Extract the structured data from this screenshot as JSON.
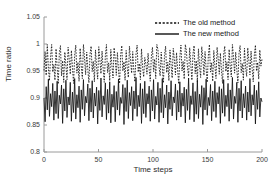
{
  "chart_data": {
    "type": "line",
    "title": "",
    "xlabel": "Time steps",
    "ylabel": "Time ratio",
    "xlim": [
      0,
      200
    ],
    "ylim": [
      0.8,
      1.05
    ],
    "xticks": [
      0,
      50,
      100,
      150,
      200
    ],
    "xtick_labels": [
      "0",
      "50",
      "100",
      "150",
      "200"
    ],
    "yticks": [
      0.8,
      0.85,
      0.9,
      0.95,
      1.0,
      1.05
    ],
    "ytick_labels": [
      "0.8",
      "0.85",
      "0.9",
      "0.95",
      "1",
      "1.05"
    ],
    "grid": false,
    "legend_position": "top-right",
    "series": [
      {
        "name": "The old method",
        "style": "dashed",
        "color": "#000000",
        "values": [
          0.951,
          0.986,
          0.942,
          0.999,
          0.955,
          0.932,
          0.977,
          0.999,
          0.948,
          0.962,
          0.933,
          0.991,
          0.957,
          0.926,
          0.983,
          0.997,
          0.941,
          0.969,
          0.929,
          0.985,
          0.961,
          0.934,
          0.994,
          0.972,
          0.944,
          0.988,
          0.955,
          0.927,
          0.979,
          0.998,
          0.946,
          0.966,
          0.931,
          0.992,
          0.959,
          0.936,
          0.999,
          0.974,
          0.943,
          0.985,
          0.953,
          0.928,
          0.981,
          0.996,
          0.949,
          0.968,
          0.93,
          0.989,
          0.958,
          0.935,
          0.995,
          0.971,
          0.945,
          0.987,
          0.954,
          0.929,
          0.978,
          0.999,
          0.947,
          0.965,
          0.932,
          0.99,
          0.96,
          0.937,
          0.993,
          0.973,
          0.942,
          0.984,
          0.952,
          0.927,
          0.98,
          0.997,
          0.95,
          0.967,
          0.933,
          0.988,
          0.956,
          0.938,
          0.996,
          0.97,
          0.946,
          0.986,
          0.951,
          0.93,
          0.982,
          0.998,
          0.948,
          0.964,
          0.934,
          0.991,
          0.957,
          0.939,
          0.975,
          0.963,
          0.944,
          0.983,
          0.953,
          0.931,
          0.977,
          0.994,
          0.949,
          0.972,
          0.936,
          0.999,
          0.99,
          0.958,
          0.941,
          0.985,
          0.955,
          0.928,
          0.979,
          0.996,
          0.947,
          0.966,
          0.932,
          0.989,
          0.961,
          0.937,
          0.992,
          0.971,
          0.943,
          0.984,
          0.952,
          0.926,
          0.976,
          0.998,
          0.95,
          0.968,
          0.935,
          0.999,
          0.987,
          0.956,
          0.94,
          0.993,
          0.962,
          0.933,
          0.981,
          0.997,
          0.945,
          0.969,
          0.93,
          0.991,
          0.959,
          0.938,
          0.995,
          0.974,
          0.942,
          0.986,
          0.954,
          0.929,
          0.978,
          0.999,
          0.948,
          0.965,
          0.931,
          0.988,
          0.96,
          0.936,
          0.994,
          0.973,
          0.944,
          0.983,
          0.951,
          0.927,
          0.98,
          0.996,
          0.949,
          0.967,
          0.934,
          0.99,
          0.958,
          0.939,
          0.999,
          0.975,
          0.946,
          0.985,
          0.953,
          0.928,
          0.982,
          0.997,
          0.947,
          0.964,
          0.933,
          0.992,
          0.957,
          0.94,
          0.993,
          0.97,
          0.943,
          0.987,
          0.955,
          0.93,
          0.979,
          0.998,
          0.95,
          0.966,
          0.935,
          0.989,
          0.959,
          0.972
        ]
      },
      {
        "name": "The new method",
        "style": "solid",
        "color": "#000000",
        "values": [
          0.9,
          0.856,
          0.921,
          0.878,
          0.935,
          0.866,
          0.908,
          0.884,
          0.927,
          0.859,
          0.913,
          0.871,
          0.931,
          0.862,
          0.905,
          0.889,
          0.924,
          0.853,
          0.917,
          0.876,
          0.933,
          0.864,
          0.902,
          0.887,
          0.929,
          0.857,
          0.911,
          0.873,
          0.936,
          0.861,
          0.906,
          0.882,
          0.922,
          0.855,
          0.915,
          0.879,
          0.934,
          0.867,
          0.903,
          0.891,
          0.926,
          0.858,
          0.918,
          0.874,
          0.932,
          0.863,
          0.909,
          0.885,
          0.92,
          0.852,
          0.914,
          0.877,
          0.937,
          0.865,
          0.904,
          0.888,
          0.928,
          0.86,
          0.916,
          0.872,
          0.93,
          0.854,
          0.907,
          0.883,
          0.923,
          0.856,
          0.912,
          0.878,
          0.935,
          0.868,
          0.901,
          0.89,
          0.925,
          0.851,
          0.919,
          0.875,
          0.933,
          0.862,
          0.91,
          0.886,
          0.921,
          0.858,
          0.913,
          0.88,
          0.938,
          0.866,
          0.905,
          0.884,
          0.927,
          0.853,
          0.917,
          0.871,
          0.931,
          0.864,
          0.908,
          0.889,
          0.922,
          0.857,
          0.915,
          0.876,
          0.934,
          0.861,
          0.903,
          0.887,
          0.929,
          0.855,
          0.918,
          0.873,
          0.936,
          0.863,
          0.906,
          0.882,
          0.924,
          0.852,
          0.911,
          0.879,
          0.932,
          0.867,
          0.902,
          0.891,
          0.926,
          0.859,
          0.914,
          0.874,
          0.93,
          0.865,
          0.909,
          0.885,
          0.92,
          0.854,
          0.916,
          0.877,
          0.937,
          0.86,
          0.904,
          0.888,
          0.928,
          0.856,
          0.912,
          0.87,
          0.933,
          0.862,
          0.907,
          0.883,
          0.923,
          0.851,
          0.919,
          0.878,
          0.935,
          0.868,
          0.901,
          0.886,
          0.925,
          0.858,
          0.913,
          0.875,
          0.931,
          0.864,
          0.91,
          0.889,
          0.921,
          0.853,
          0.917,
          0.872,
          0.934,
          0.866,
          0.905,
          0.884,
          0.927,
          0.857,
          0.915,
          0.88,
          0.938,
          0.861,
          0.903,
          0.89,
          0.929,
          0.855,
          0.918,
          0.876,
          0.932,
          0.863,
          0.908,
          0.882,
          0.922,
          0.859,
          0.911,
          0.874,
          0.936,
          0.867,
          0.906,
          0.887,
          0.924,
          0.852,
          0.914,
          0.879,
          0.93,
          0.865,
          0.9,
          0.893
        ]
      }
    ]
  },
  "legend": {
    "items": [
      {
        "label": "The old method",
        "sample": "dashed-line-sample"
      },
      {
        "label": "The new method",
        "sample": "solid-line-sample"
      }
    ]
  }
}
